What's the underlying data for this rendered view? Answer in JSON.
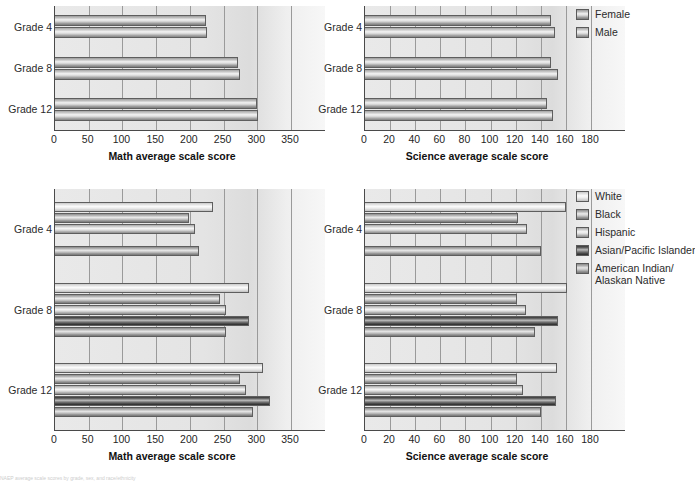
{
  "figure": {
    "footnote": "NAEP average scale scores by grade, sex, and race/ethnicity"
  },
  "legends": {
    "gender": {
      "items": [
        {
          "label": "Female",
          "key": "female"
        },
        {
          "label": "Male",
          "key": "male"
        }
      ]
    },
    "race": {
      "items": [
        {
          "label": "White",
          "label2": "",
          "key": "white"
        },
        {
          "label": "Black",
          "label2": "",
          "key": "black"
        },
        {
          "label": "Hispanic",
          "label2": "",
          "key": "hispanic"
        },
        {
          "label": "Asian/Pacific Islander",
          "label2": "",
          "key": "asian"
        },
        {
          "label": "American Indian/",
          "label2": "Alaskan Native",
          "key": "ai"
        }
      ]
    }
  },
  "chart_data": [
    {
      "id": "math-gender",
      "type": "bar",
      "orientation": "horizontal",
      "title": "",
      "xlabel": "Math average scale score",
      "ylabel": "",
      "categories": [
        "Grade 4",
        "Grade 8",
        "Grade 12"
      ],
      "xlim": [
        0,
        350
      ],
      "xticks": [
        0,
        50,
        100,
        150,
        200,
        250,
        300,
        350
      ],
      "grid": true,
      "legend": "Female, Male",
      "series": [
        {
          "name": "Female",
          "key": "female",
          "values": [
            224,
            272,
            299
          ]
        },
        {
          "name": "Male",
          "key": "male",
          "values": [
            226,
            274,
            301
          ]
        }
      ]
    },
    {
      "id": "science-gender",
      "type": "bar",
      "orientation": "horizontal",
      "title": "",
      "xlabel": "Science average scale score",
      "ylabel": "",
      "categories": [
        "Grade 4",
        "Grade 8",
        "Grade 12"
      ],
      "xlim": [
        0,
        180
      ],
      "xticks": [
        0,
        20,
        40,
        60,
        80,
        100,
        120,
        140,
        160,
        180
      ],
      "grid": true,
      "legend": "Female, Male",
      "series": [
        {
          "name": "Female",
          "key": "female",
          "values": [
            148,
            148,
            145
          ]
        },
        {
          "name": "Male",
          "key": "male",
          "values": [
            151,
            154,
            150
          ]
        }
      ]
    },
    {
      "id": "math-race",
      "type": "bar",
      "orientation": "horizontal",
      "title": "",
      "xlabel": "Math average scale score",
      "ylabel": "",
      "categories": [
        "Grade 4",
        "Grade 8",
        "Grade 12"
      ],
      "xlim": [
        0,
        350
      ],
      "xticks": [
        0,
        50,
        100,
        150,
        200,
        250,
        300,
        350
      ],
      "grid": true,
      "legend": "White, Black, Hispanic, Asian/Pacific Islander, American Indian/Alaskan Native",
      "series": [
        {
          "name": "White",
          "key": "white",
          "values": [
            234,
            287,
            308
          ]
        },
        {
          "name": "Black",
          "key": "black",
          "values": [
            198,
            244,
            274
          ]
        },
        {
          "name": "Hispanic",
          "key": "hispanic",
          "values": [
            208,
            253,
            283
          ]
        },
        {
          "name": "Asian/Pacific Islander",
          "key": "asian",
          "values": [
            null,
            288,
            319
          ]
        },
        {
          "name": "American Indian/Alaskan Native",
          "key": "ai",
          "values": [
            214,
            253,
            293
          ]
        }
      ]
    },
    {
      "id": "science-race",
      "type": "bar",
      "orientation": "horizontal",
      "title": "",
      "xlabel": "Science average scale score",
      "ylabel": "",
      "categories": [
        "Grade 4",
        "Grade 8",
        "Grade 12"
      ],
      "xlim": [
        0,
        180
      ],
      "xticks": [
        0,
        20,
        40,
        60,
        80,
        100,
        120,
        140,
        160,
        180
      ],
      "grid": true,
      "legend": "White, Black, Hispanic, Asian/Pacific Islander, American Indian/Alaskan Native",
      "series": [
        {
          "name": "White",
          "key": "white",
          "values": [
            160,
            161,
            153
          ]
        },
        {
          "name": "Black",
          "key": "black",
          "values": [
            122,
            121,
            121
          ]
        },
        {
          "name": "Hispanic",
          "key": "hispanic",
          "values": [
            129,
            128,
            126
          ]
        },
        {
          "name": "Asian/Pacific Islander",
          "key": "asian",
          "values": [
            null,
            154,
            152
          ]
        },
        {
          "name": "American Indian/Alaskan Native",
          "key": "ai",
          "values": [
            140,
            135,
            140
          ]
        }
      ]
    }
  ]
}
